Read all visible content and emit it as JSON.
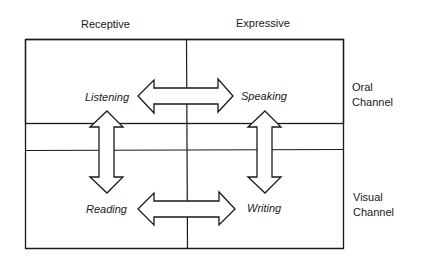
{
  "columns": {
    "left": "Receptive",
    "right": "Expressive"
  },
  "rows": {
    "top": {
      "line1": "Oral",
      "line2": "Channel"
    },
    "bottom": {
      "line1": "Visual",
      "line2": "Channel"
    }
  },
  "skills": {
    "listening": "Listening",
    "speaking": "Speaking",
    "reading": "Reading",
    "writing": "Writing"
  },
  "colors": {
    "line": "#1a1a1a",
    "background": "#ffffff"
  }
}
